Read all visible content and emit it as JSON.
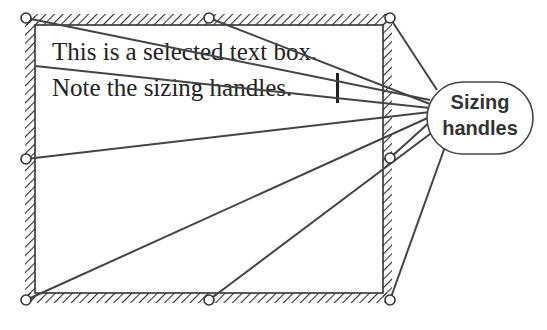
{
  "textbox": {
    "line1": "This is a selected text box.",
    "line2": "Note the sizing handles."
  },
  "callout": {
    "line1": "Sizing",
    "line2": "handles"
  },
  "handles": [
    {
      "name": "top-left",
      "x": 26,
      "y": 18
    },
    {
      "name": "top-middle",
      "x": 209,
      "y": 18
    },
    {
      "name": "top-right",
      "x": 390,
      "y": 18
    },
    {
      "name": "middle-left",
      "x": 26,
      "y": 159
    },
    {
      "name": "middle-right",
      "x": 390,
      "y": 158
    },
    {
      "name": "bottom-left",
      "x": 26,
      "y": 300
    },
    {
      "name": "bottom-middle",
      "x": 209,
      "y": 300
    },
    {
      "name": "bottom-right",
      "x": 390,
      "y": 300
    }
  ],
  "colors": {
    "line": "#333333",
    "hatch": "#333333",
    "background": "#ffffff"
  }
}
